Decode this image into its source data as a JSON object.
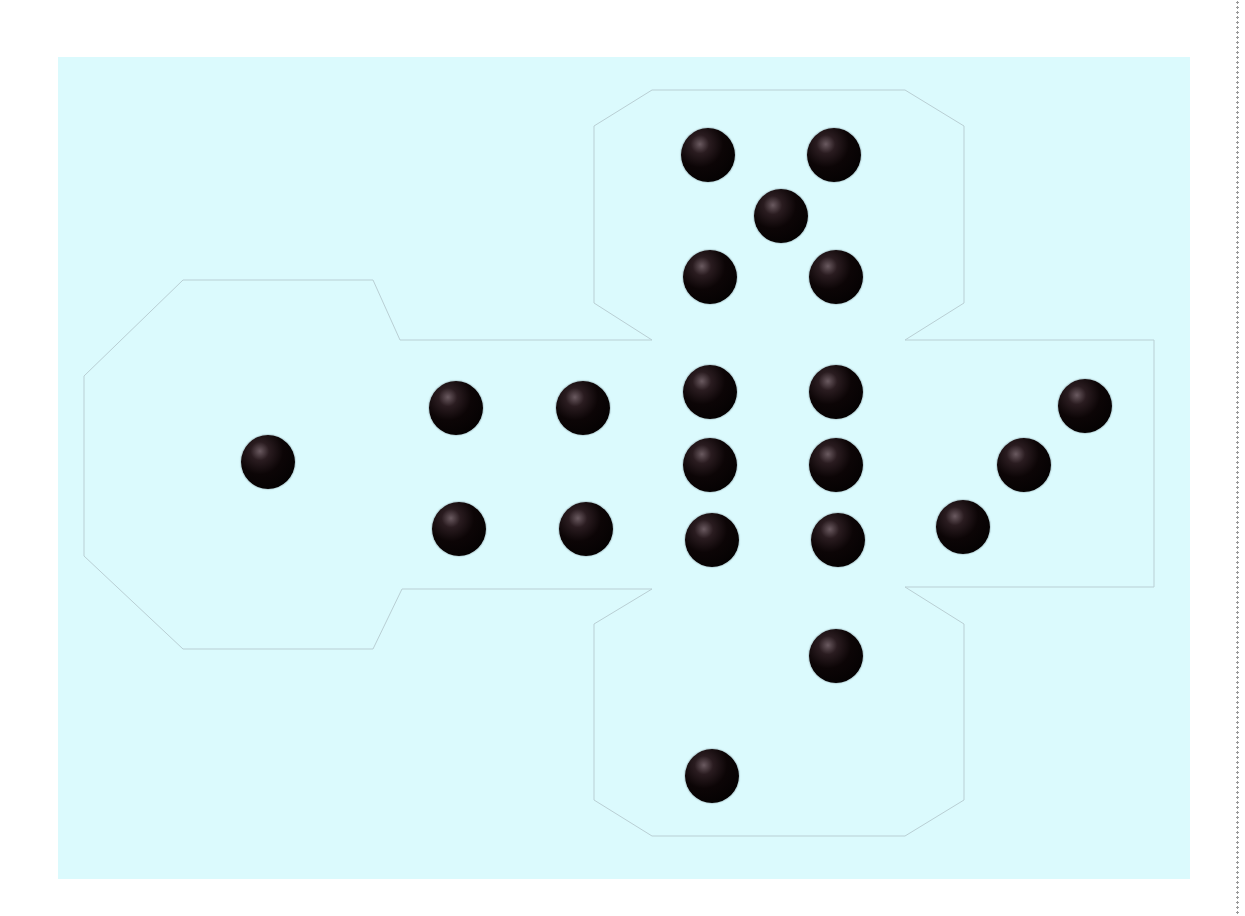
{
  "figure": {
    "background_color": "#dbfafd",
    "pip_color": "#0c0506",
    "outline_color": "#b9cfd4"
  },
  "faces": [
    {
      "name": "top",
      "value": 5,
      "pips": [
        [
          708,
          155
        ],
        [
          834,
          155
        ],
        [
          781,
          216
        ],
        [
          710,
          277
        ],
        [
          836,
          277
        ]
      ]
    },
    {
      "name": "left",
      "value": 1,
      "pips": [
        [
          268,
          462
        ]
      ]
    },
    {
      "name": "center-left",
      "value": 4,
      "pips": [
        [
          456,
          408
        ],
        [
          583,
          408
        ],
        [
          459,
          529
        ],
        [
          586,
          529
        ]
      ]
    },
    {
      "name": "center",
      "value": 6,
      "pips": [
        [
          710,
          392
        ],
        [
          836,
          392
        ],
        [
          710,
          465
        ],
        [
          836,
          465
        ],
        [
          712,
          540
        ],
        [
          838,
          540
        ]
      ]
    },
    {
      "name": "right",
      "value": 3,
      "pips": [
        [
          1085,
          406
        ],
        [
          1024,
          465
        ],
        [
          963,
          527
        ]
      ]
    },
    {
      "name": "bottom",
      "value": 2,
      "pips": [
        [
          836,
          656
        ],
        [
          712,
          776
        ]
      ]
    }
  ]
}
